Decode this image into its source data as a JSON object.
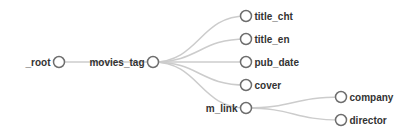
{
  "diagram": {
    "type": "tree",
    "orientation": "left-to-right",
    "colors": {
      "link": "#cccccc",
      "node_stroke": "#6e6e6e",
      "node_fill": "#ffffff",
      "label": "#333333"
    },
    "nodes": [
      {
        "id": "root",
        "label": "_root",
        "x": 59,
        "y": 62,
        "label_side": "left",
        "interactable": true
      },
      {
        "id": "movies_tag",
        "label": "movies_tag",
        "x": 153,
        "y": 62,
        "label_side": "left",
        "interactable": true
      },
      {
        "id": "title_cht",
        "label": "title_cht",
        "x": 246,
        "y": 16,
        "label_side": "right",
        "interactable": true
      },
      {
        "id": "title_en",
        "label": "title_en",
        "x": 246,
        "y": 39,
        "label_side": "right",
        "interactable": true
      },
      {
        "id": "pub_date",
        "label": "pub_date",
        "x": 246,
        "y": 62,
        "label_side": "right",
        "interactable": true
      },
      {
        "id": "cover",
        "label": "cover",
        "x": 246,
        "y": 85,
        "label_side": "right",
        "interactable": true
      },
      {
        "id": "m_link",
        "label": "m_link",
        "x": 246,
        "y": 108,
        "label_side": "left",
        "interactable": true
      },
      {
        "id": "company",
        "label": "company",
        "x": 341,
        "y": 97,
        "label_side": "right",
        "interactable": true
      },
      {
        "id": "director",
        "label": "director",
        "x": 341,
        "y": 120,
        "label_side": "right",
        "interactable": true
      }
    ],
    "links": [
      {
        "source": "root",
        "target": "movies_tag"
      },
      {
        "source": "movies_tag",
        "target": "title_cht"
      },
      {
        "source": "movies_tag",
        "target": "title_en"
      },
      {
        "source": "movies_tag",
        "target": "pub_date"
      },
      {
        "source": "movies_tag",
        "target": "cover"
      },
      {
        "source": "movies_tag",
        "target": "m_link"
      },
      {
        "source": "m_link",
        "target": "company"
      },
      {
        "source": "m_link",
        "target": "director"
      }
    ]
  }
}
